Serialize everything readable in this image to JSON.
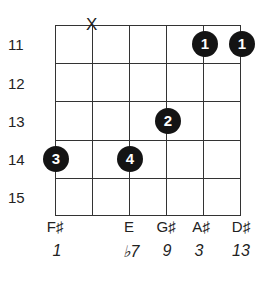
{
  "diagram": {
    "type": "guitar-chord-chart",
    "strings": 6,
    "frets_shown": 5,
    "fret_labels": [
      "11",
      "12",
      "13",
      "14",
      "15"
    ],
    "muted_strings": [
      {
        "string": 5,
        "symbol": "X"
      }
    ],
    "fingers": [
      {
        "string": 6,
        "fret": 14,
        "finger": "3"
      },
      {
        "string": 4,
        "fret": 14,
        "finger": "4"
      },
      {
        "string": 3,
        "fret": 13,
        "finger": "2"
      },
      {
        "string": 2,
        "fret": 11,
        "finger": "1"
      },
      {
        "string": 1,
        "fret": 11,
        "finger": "1"
      }
    ],
    "notes": [
      {
        "string": 6,
        "note": "F♯",
        "interval": "1"
      },
      {
        "string": 4,
        "note": "E",
        "interval": "♭7"
      },
      {
        "string": 3,
        "note": "G♯",
        "interval": "9"
      },
      {
        "string": 2,
        "note": "A♯",
        "interval": "3"
      },
      {
        "string": 1,
        "note": "D♯",
        "interval": "13"
      }
    ],
    "colors": {
      "line": "#333333",
      "dot": "#141414",
      "dot_text": "#ffffff",
      "text": "#222222"
    }
  }
}
